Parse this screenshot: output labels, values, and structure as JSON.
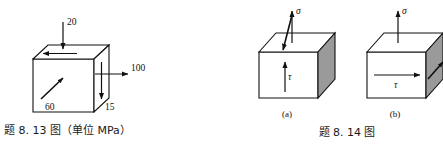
{
  "sheet": {
    "background_color": "#ffffff",
    "ink_color": "#111111",
    "shaded_face_color": "#9a9a9a"
  },
  "figures": [
    {
      "id": "fig-8-13",
      "caption": "题 8. 13 图（单位 MPa）",
      "unit": "MPa",
      "type": "stress-element-cube",
      "labels": [
        {
          "name": "stress-top",
          "text": "20",
          "position": "top",
          "direction": "downward-into-top-face",
          "value": 20
        },
        {
          "name": "stress-right",
          "text": "100",
          "position": "right",
          "direction": "outward-right",
          "value": 100
        },
        {
          "name": "stress-right-shear",
          "text": "15",
          "position": "lower-right",
          "direction": "downward-on-right-face",
          "value": 15
        },
        {
          "name": "stress-front-diagonal",
          "text": "60",
          "position": "front-face",
          "direction": "diagonal-up-right",
          "value": 60
        }
      ],
      "top_face_arrow": {
        "name": "top-face-shear-arrow",
        "direction": "left"
      }
    },
    {
      "id": "fig-8-14",
      "caption": "题 8. 14 图",
      "type": "stress-element-cube-pair",
      "panels": [
        {
          "label": "(a)",
          "normal_stress": {
            "symbol": "σ",
            "direction": "up-then-down-into-top-face"
          },
          "shear_stress": {
            "symbol": "τ",
            "face": "front",
            "direction": "up"
          },
          "right_face": "shaded"
        },
        {
          "label": "(b)",
          "normal_stress": {
            "symbol": "σ",
            "direction": "up"
          },
          "shear_stress": {
            "symbol": "τ",
            "face": "front",
            "direction": "right"
          },
          "right_face_arrow": {
            "name": "right-face-shear-arrow",
            "direction": "diagonal-up-right"
          },
          "right_face": "shaded"
        }
      ]
    }
  ]
}
